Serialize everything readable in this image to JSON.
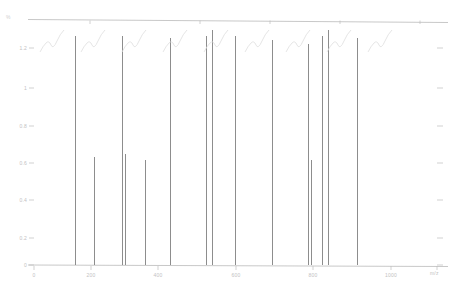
{
  "figure": {
    "kind": "line-spectrum",
    "background": "#ffffff",
    "spike_color": "#8d8d8d",
    "axis_color": "#b0b0b0",
    "tick_color": "#bdbdbd",
    "label_color": "#c2c2c2",
    "annotation_color": "#dedede",
    "top_axis_label": "%"
  },
  "chart_data": {
    "type": "bar",
    "title": "",
    "subtitle": "",
    "xlabel": "",
    "ylabel": "",
    "grid": false,
    "legend": null,
    "xlim": [
      0,
      1000
    ],
    "ylim": [
      0,
      100
    ],
    "x_ticks": [
      0,
      200,
      400,
      600,
      800,
      1000
    ],
    "x_tick_labels": [
      "0",
      "200",
      "400",
      "600",
      "800",
      "1000"
    ],
    "y_ticks": [
      0,
      16.7,
      33.3,
      50,
      66.7,
      83.3,
      100
    ],
    "y_tick_labels": [
      "0",
      "0.2",
      "0.4",
      "0.6",
      "0.8",
      "1",
      "1.2"
    ],
    "categories": [
      "168",
      "188",
      "207",
      "227",
      "253",
      "280",
      "297",
      "313",
      "355",
      "375",
      "438",
      "527",
      "610",
      "678",
      "690",
      "745"
    ],
    "x": [
      168,
      188,
      207,
      227,
      253,
      280,
      297,
      313,
      355,
      375,
      438,
      527,
      610,
      678,
      690,
      745
    ],
    "values": [
      100,
      33,
      100,
      34,
      100,
      27,
      100,
      100,
      100,
      100,
      100,
      100,
      55,
      100,
      100,
      100
    ],
    "annotations": [
      {
        "x": 120,
        "label": "A"
      },
      {
        "x": 195,
        "label": "B"
      },
      {
        "x": 265,
        "label": "C"
      },
      {
        "x": 330,
        "label": "D"
      },
      {
        "x": 420,
        "label": "E"
      },
      {
        "x": 500,
        "label": "F"
      },
      {
        "x": 580,
        "label": "G"
      },
      {
        "x": 660,
        "label": "H"
      },
      {
        "x": 740,
        "label": "I"
      }
    ]
  },
  "y_axis": {
    "labels": [
      "1.2",
      "1",
      "0.8",
      "0.6",
      "0.4",
      "0.2",
      "0"
    ],
    "positions_px": [
      48,
      88,
      126,
      163,
      200,
      238,
      265
    ]
  },
  "x_axis": {
    "labels": [
      "0",
      "200",
      "400",
      "600",
      "800",
      "1000"
    ],
    "positions_px": [
      34,
      91,
      158,
      236,
      313,
      391,
      437
    ]
  },
  "spikes_px": [
    {
      "x": 75,
      "top": 36,
      "w": 1
    },
    {
      "x": 94,
      "top": 157,
      "w": 1
    },
    {
      "x": 122,
      "top": 36,
      "w": 1
    },
    {
      "x": 125,
      "top": 154,
      "w": 1
    },
    {
      "x": 145,
      "top": 160,
      "w": 1
    },
    {
      "x": 170,
      "top": 38,
      "w": 1
    },
    {
      "x": 206,
      "top": 36,
      "w": 1
    },
    {
      "x": 212,
      "top": 30,
      "w": 1
    },
    {
      "x": 235,
      "top": 36,
      "w": 1
    },
    {
      "x": 272,
      "top": 40,
      "w": 1
    },
    {
      "x": 308,
      "top": 44,
      "w": 1
    },
    {
      "x": 311,
      "top": 160,
      "w": 1
    },
    {
      "x": 322,
      "top": 36,
      "w": 1
    },
    {
      "x": 328,
      "top": 30,
      "w": 1
    },
    {
      "x": 357,
      "top": 38,
      "w": 1
    }
  ],
  "top_axis": {
    "y_px": 20,
    "ticks_px": [
      90,
      200,
      270,
      340,
      420
    ],
    "label": "%"
  },
  "right_axis": {
    "ticks_px": [
      48,
      88,
      126,
      163,
      200,
      238,
      265
    ],
    "corner_label": "m/z"
  }
}
